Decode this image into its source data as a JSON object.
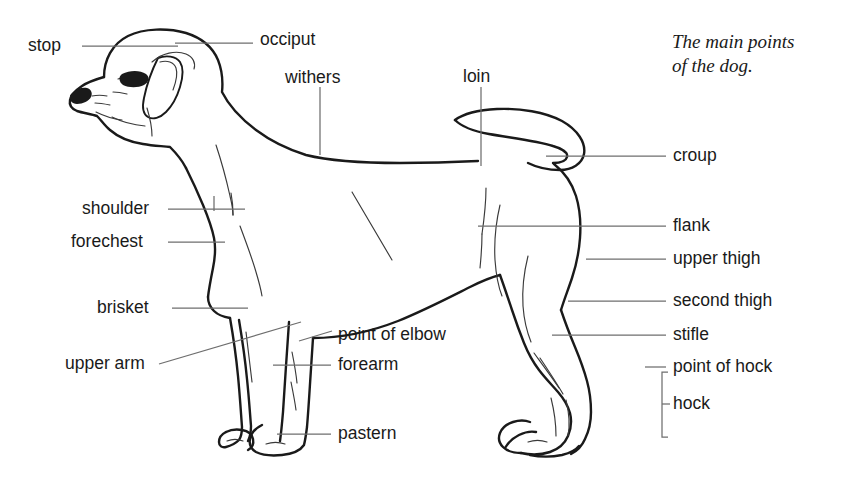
{
  "caption": {
    "text": "The main points\nof the dog.",
    "x": 672,
    "y": 30
  },
  "colors": {
    "ink": "#1a1a1a",
    "leader": "#6e6e6e",
    "background": "#ffffff"
  },
  "labels": [
    {
      "name": "stop",
      "text": "stop",
      "x": 28,
      "y": 37,
      "align": "left"
    },
    {
      "name": "occiput",
      "text": "occiput",
      "x": 260,
      "y": 31,
      "align": "left"
    },
    {
      "name": "withers",
      "text": "withers",
      "x": 285,
      "y": 69,
      "align": "left"
    },
    {
      "name": "loin",
      "text": "loin",
      "x": 463,
      "y": 68,
      "align": "left"
    },
    {
      "name": "croup",
      "text": "croup",
      "x": 673,
      "y": 147,
      "align": "left"
    },
    {
      "name": "shoulder",
      "text": "shoulder",
      "x": 82,
      "y": 200,
      "align": "left"
    },
    {
      "name": "flank",
      "text": "flank",
      "x": 673,
      "y": 217,
      "align": "left"
    },
    {
      "name": "forechest",
      "text": "forechest",
      "x": 71,
      "y": 233,
      "align": "left"
    },
    {
      "name": "upper-thigh",
      "text": "upper thigh",
      "x": 673,
      "y": 250,
      "align": "left"
    },
    {
      "name": "second-thigh",
      "text": "second thigh",
      "x": 673,
      "y": 292,
      "align": "left"
    },
    {
      "name": "brisket",
      "text": "brisket",
      "x": 97,
      "y": 299,
      "align": "left"
    },
    {
      "name": "stifle",
      "text": "stifle",
      "x": 673,
      "y": 326,
      "align": "left"
    },
    {
      "name": "point-of-elbow",
      "text": "point of elbow",
      "x": 338,
      "y": 326,
      "align": "left"
    },
    {
      "name": "forearm",
      "text": "forearm",
      "x": 338,
      "y": 356,
      "align": "left"
    },
    {
      "name": "point-of-hock",
      "text": "point of hock",
      "x": 673,
      "y": 358,
      "align": "left"
    },
    {
      "name": "upper-arm",
      "text": "upper arm",
      "x": 65,
      "y": 355,
      "align": "left"
    },
    {
      "name": "hock",
      "text": "hock",
      "x": 673,
      "y": 395,
      "align": "left"
    },
    {
      "name": "pastern",
      "text": "pastern",
      "x": 338,
      "y": 425,
      "align": "left"
    }
  ],
  "leaders": {
    "stop": {
      "type": "line",
      "points": "82,46 178,46"
    },
    "occiput": {
      "type": "line",
      "points": "175,43 253,43"
    },
    "withers": {
      "type": "line",
      "points": "320,87 320,155"
    },
    "loin": {
      "type": "line",
      "points": "481,87 481,166"
    },
    "croup": {
      "type": "line",
      "points": "546,156 666,156"
    },
    "shoulder": {
      "type": "line",
      "points": "168,209 245,209"
    },
    "flank": {
      "type": "line",
      "points": "478,226 666,226"
    },
    "forechest": {
      "type": "line",
      "points": "168,242 225,242"
    },
    "upper_thigh": {
      "type": "line",
      "points": "586,259 666,259"
    },
    "second_thigh": {
      "type": "line",
      "points": "568,301 666,301"
    },
    "brisket": {
      "type": "line",
      "points": "172,308 248,308"
    },
    "stifle": {
      "type": "line",
      "points": "552,335 666,335"
    },
    "point_of_elbow": {
      "type": "line",
      "points": "300,340 331,332"
    },
    "forearm": {
      "type": "line",
      "points": "273,365 331,365"
    },
    "point_of_hock": {
      "type": "line",
      "points": "645,367 666,367"
    },
    "upper_arm": {
      "type": "line",
      "points": "159,364 301,322"
    },
    "pastern": {
      "type": "line",
      "points": "277,434 331,434"
    },
    "hock_bracket": {
      "type": "bracket",
      "x": 662,
      "y_top": 372,
      "y_bottom": 437,
      "tick": 6,
      "stub_y": 404,
      "stub_x": 668
    }
  },
  "figure": {
    "name": "dog-side-view-line-drawing",
    "parts": [
      "head",
      "ear",
      "eye",
      "nose",
      "muzzle",
      "neck",
      "withers",
      "back",
      "loin",
      "croup",
      "tail",
      "chest",
      "brisket",
      "belly",
      "flank",
      "shoulder",
      "upper-arm",
      "forearm",
      "pastern",
      "front-paw",
      "upper-thigh",
      "second-thigh",
      "stifle",
      "hock",
      "rear-paw"
    ]
  }
}
